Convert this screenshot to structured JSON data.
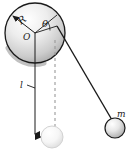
{
  "figure": {
    "background_color": "#ffffff",
    "ink_color": "#1a1a1a"
  },
  "disk": {
    "name": "pulley-disk",
    "center_label": "O",
    "radius_label": "R",
    "angle_label": "θ",
    "center_x": 35,
    "center_y": 33,
    "radius": 30,
    "fill_light": "#fdfdfd",
    "fill_dark": "#b9b9b9",
    "edge_color": "#1a1a1a",
    "shadow_color": "#b0b0b0"
  },
  "length_marker": {
    "name": "length-l",
    "label": "l",
    "label_x": 24,
    "label_y": 86,
    "line_x": 35,
    "line_top": 33,
    "line_bottom": 136,
    "arrow": "down"
  },
  "dashed_reference": {
    "name": "vertical-dashed-reference",
    "x": 55,
    "top": 40,
    "bottom": 130,
    "dash": "3 3",
    "color": "#9a9a9a"
  },
  "string": {
    "name": "taut-string",
    "from_x": 57,
    "from_y": 26,
    "to_x": 113,
    "to_y": 121,
    "color": "#1a1a1a"
  },
  "bob_swung": {
    "name": "mass-bob",
    "label": "m",
    "cx": 115,
    "cy": 128,
    "r": 10,
    "fill_light": "#ffffff",
    "fill_dark": "#a8a8a8"
  },
  "bob_rest": {
    "name": "mass-bob-rest-position",
    "label": "",
    "cx": 52,
    "cy": 137,
    "r": 11,
    "fill_light": "#ffffff",
    "fill_dark": "#e2e2e2"
  }
}
